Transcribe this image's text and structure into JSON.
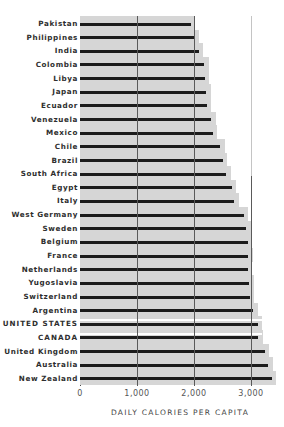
{
  "chart_data": {
    "type": "bar",
    "orientation": "horizontal",
    "title": "",
    "xlabel": "DAILY CALORIES PER CAPITA",
    "ylabel": "",
    "xlim": [
      0,
      3400
    ],
    "xticks": [
      0,
      1000,
      2000,
      3000
    ],
    "xtick_labels": [
      "0",
      "1,000",
      "2,000",
      "3,000"
    ],
    "grid": true,
    "legend": null,
    "categories": [
      "Pakistan",
      "Philippines",
      "India",
      "Colombia",
      "Libya",
      "Japan",
      "Ecuador",
      "Venezuela",
      "Mexico",
      "Chile",
      "Brazil",
      "South Africa",
      "Egypt",
      "Italy",
      "West Germany",
      "Sweden",
      "Belgium",
      "France",
      "Netherlands",
      "Yugoslavia",
      "Switzerland",
      "Argentina",
      "UNITED STATES",
      "CANADA",
      "United Kingdom",
      "Australia",
      "New Zealand"
    ],
    "values": [
      1950,
      2000,
      2080,
      2170,
      2190,
      2210,
      2230,
      2300,
      2330,
      2460,
      2500,
      2570,
      2660,
      2710,
      2880,
      2920,
      2940,
      2950,
      2950,
      2960,
      2980,
      3030,
      3120,
      3130,
      3250,
      3290,
      3360
    ],
    "highlighted": [
      "UNITED STATES",
      "CANADA"
    ]
  },
  "colors": {
    "bar": "#1c1c1c",
    "shade": "#d6d6d6",
    "gridline": "#5a5a5a",
    "label": "#2e2e2e",
    "highlight_stripe": "#ffffff"
  }
}
